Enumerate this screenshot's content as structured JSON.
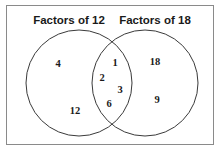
{
  "diagram": {
    "type": "venn",
    "sets": [
      {
        "label": "Factors of 12",
        "only_elements": [
          "4",
          "12"
        ]
      },
      {
        "label": "Factors of 18",
        "only_elements": [
          "18",
          "9"
        ]
      }
    ],
    "intersection_elements": [
      "1",
      "2",
      "3",
      "6"
    ],
    "colors": {
      "frame": "#8a8a8a",
      "circle_stroke": "#3a3a3a",
      "text": "#1a1a1a",
      "background": "#ffffff"
    }
  }
}
